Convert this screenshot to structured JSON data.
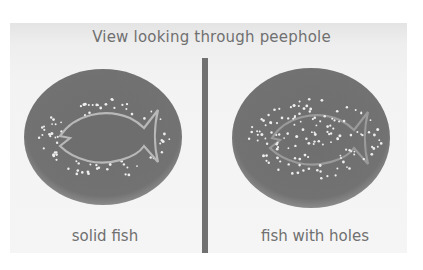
{
  "title": "View looking through peephole",
  "panels": [
    {
      "id": "left",
      "caption": "solid fish",
      "fish_style": "solid"
    },
    {
      "id": "right",
      "caption": "fish with holes",
      "fish_style": "holes"
    }
  ],
  "colors": {
    "plate": "#707070",
    "background": "#f3f3f3",
    "text": "#707070",
    "dots": "#f0f0f0"
  }
}
